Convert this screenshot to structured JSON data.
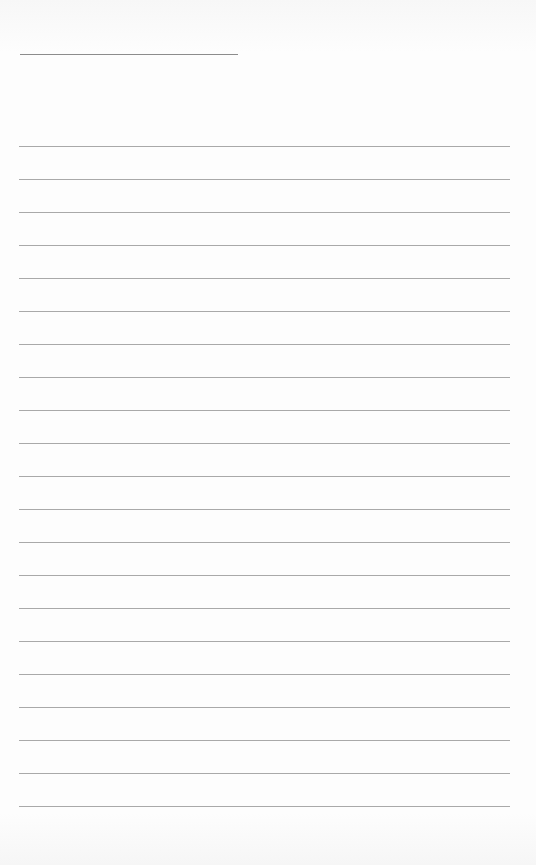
{
  "page": {
    "type": "blank lined writing sheet",
    "title_line": {
      "text": ""
    },
    "ruled_lines": {
      "count": 21,
      "first_y": 146,
      "spacing": 33,
      "color": "#9a9a9a"
    },
    "lines": [
      "",
      "",
      "",
      "",
      "",
      "",
      "",
      "",
      "",
      "",
      "",
      "",
      "",
      "",
      "",
      "",
      "",
      "",
      "",
      "",
      ""
    ]
  }
}
